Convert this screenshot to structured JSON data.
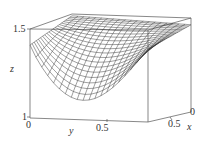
{
  "chart_data": {
    "type": "surface3d",
    "title": "",
    "xlabel": "x",
    "ylabel": "y",
    "zlabel": "z",
    "x_ticks": [
      "0",
      "0.5"
    ],
    "y_ticks": [
      "0",
      "0.5"
    ],
    "z_ticks": [
      "1",
      "1.5"
    ],
    "xlim": [
      0,
      1
    ],
    "ylim": [
      0,
      1
    ],
    "zlim": [
      1,
      1.5
    ],
    "grid_resolution": 20,
    "surface_description": "Wireframe mesh surface, concave-down; near z=1.5 at far/back side, dropping to about z=1.15 at front corner near y=0.5, x=0",
    "style": {
      "mesh_color": "#333333",
      "box_color": "#555555",
      "background": "#ffffff"
    }
  },
  "labels": {
    "z_tick_top": "1.5",
    "z_tick_bottom": "1",
    "z_axis": "z",
    "y_tick_0": "0",
    "y_tick_05": "0.5",
    "y_axis": "y",
    "x_tick_0": "0",
    "x_tick_05": "0.5",
    "x_axis": "x"
  }
}
